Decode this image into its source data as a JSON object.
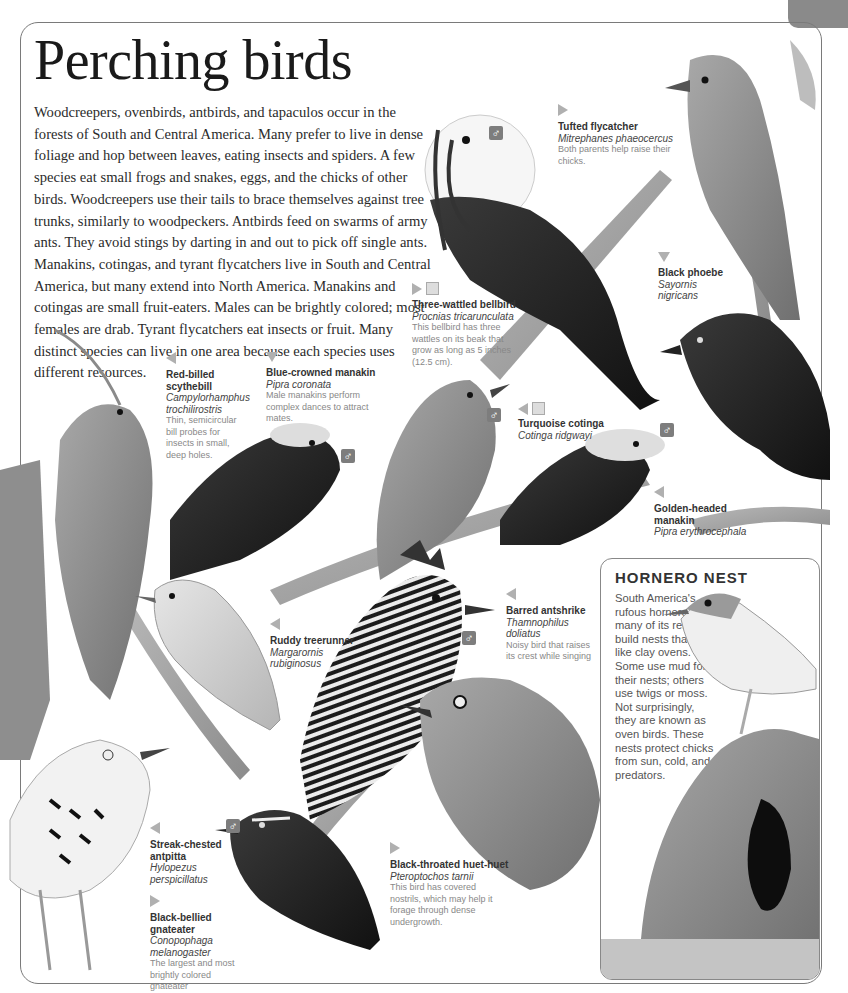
{
  "page": {
    "title": "Perching birds",
    "intro": "Woodcreepers, ovenbirds, antbirds, and tapaculos occur in the forests of South and Central America. Many prefer to live in dense foliage and hop between leaves, eating insects and spiders. A few species eat small frogs and snakes, eggs, and the chicks of other birds. Woodcreepers use their tails to brace themselves against tree trunks, similarly to woodpeckers. Antbirds feed on swarms of army ants. They avoid stings by darting in and out to pick off single ants. Manakins, cotingas, and tyrant flycatchers live in South and Central America, but many extend into North America. Manakins and cotingas are small fruit-eaters. Males can be brightly colored; most females are drab. Tyrant flycatchers eat insects or fruit. Many distinct species can live in one area because each species uses different resources."
  },
  "male_symbol": "♂",
  "captions": {
    "tufted_flycatcher": {
      "name": "Tufted flycatcher",
      "latin": "Mitrephanes phaeocercus",
      "desc": "Both parents help raise their chicks.",
      "pointer": "right"
    },
    "three_wattled_bellbird": {
      "name": "Three-wattled bellbird",
      "latin": "Procnias tricarunculata",
      "desc": "This bellbird has three wattles on its beak that grow as long as 5 inches (12.5 cm).",
      "pointer": "right",
      "size_icon": true
    },
    "black_phoebe": {
      "name": "Black phoebe",
      "latin1": "Sayornis",
      "latin2": "nigricans",
      "pointer": "down"
    },
    "red_billed_scythebill": {
      "name1": "Red-billed",
      "name2": "scythebill",
      "latin1": "Campylorhamphus",
      "latin2": "trochilirostris",
      "desc": "Thin, semicircular bill probes for insects in small, deep holes.",
      "pointer": "left"
    },
    "blue_crowned_manakin": {
      "name": "Blue-crowned manakin",
      "latin": "Pipra coronata",
      "desc": "Male manakins perform complex dances to attract mates.",
      "pointer": "down"
    },
    "turquoise_cotinga": {
      "name": "Turquoise cotinga",
      "latin": "Cotinga ridgwayi",
      "pointer": "left",
      "size_icon": true
    },
    "golden_headed_manakin": {
      "name1": "Golden-headed",
      "name2": "manakin",
      "latin": "Pipra erythrocephala",
      "pointer": "left"
    },
    "ruddy_treerunner": {
      "name": "Ruddy treerunner",
      "latin1": "Margarornis",
      "latin2": "rubiginosus",
      "pointer": "left"
    },
    "barred_antshrike": {
      "name": "Barred antshrike",
      "latin1": "Thamnophilus",
      "latin2": "doliatus",
      "desc": "Noisy bird that raises its crest while singing",
      "pointer": "left"
    },
    "streak_chested_antpitta": {
      "name1": "Streak-chested",
      "name2": "antpitta",
      "latin1": "Hylopezus",
      "latin2": "perspicillatus",
      "pointer": "left"
    },
    "black_bellied_gnateater": {
      "name1": "Black-bellied",
      "name2": "gnateater",
      "latin1": "Conopophaga",
      "latin2": "melanogaster",
      "desc": "The largest and most brightly colored gnateater",
      "pointer": "right"
    },
    "black_throated_huet_huet": {
      "name": "Black-throated huet-huet",
      "latin": "Pteroptochos tarnii",
      "desc": "This bird has covered nostrils, which may help it forage through dense undergrowth.",
      "pointer": "right"
    }
  },
  "hornero_nest": {
    "title": "HORNERO NEST",
    "text": "South America's rufous hornero and many of its relatives build nests that look like clay ovens. Some use mud for their nests; others use twigs or moss. Not surprisingly, they are known as oven birds. These nests protect chicks from sun, cold, and predators."
  },
  "colors": {
    "frame": "#7a7a7a",
    "pointer": "#b0b0b0",
    "male_badge": "#7d7d7d",
    "text": "#2b2b2b",
    "desc": "#888888"
  }
}
